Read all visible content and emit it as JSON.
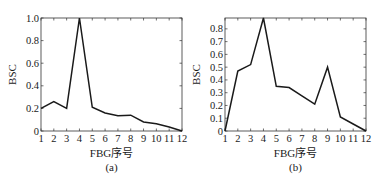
{
  "chart_data": [
    {
      "type": "line",
      "panel": "(a)",
      "title": "",
      "xlabel": "FBG序号",
      "ylabel": "BSC",
      "caption": "(a)",
      "x": [
        1,
        2,
        3,
        4,
        5,
        6,
        7,
        8,
        9,
        10,
        11,
        12
      ],
      "series": [
        {
          "name": "BSC",
          "values": [
            0.2,
            0.26,
            0.2,
            1.0,
            0.21,
            0.16,
            0.135,
            0.14,
            0.08,
            0.065,
            0.035,
            0.0
          ]
        }
      ],
      "xlim": [
        1,
        12
      ],
      "ylim": [
        0,
        1.0
      ],
      "xticks": [
        "1",
        "2",
        "3",
        "4",
        "5",
        "6",
        "7",
        "8",
        "9",
        "10",
        "11",
        "12"
      ],
      "yticks": [
        {
          "value": 0,
          "label": "0"
        },
        {
          "value": 0.2,
          "label": "0.2"
        },
        {
          "value": 0.4,
          "label": "0.4"
        },
        {
          "value": 0.6,
          "label": "0.6"
        },
        {
          "value": 0.8,
          "label": "0.8"
        },
        {
          "value": 1.0,
          "label": "1.0"
        }
      ],
      "grid": false,
      "legend": null,
      "line_color": "#1a1a1a"
    },
    {
      "type": "line",
      "panel": "(b)",
      "title": "",
      "xlabel": "FBG序号",
      "ylabel": "BSC",
      "caption": "(b)",
      "x": [
        1,
        2,
        3,
        4,
        5,
        6,
        7,
        8,
        9,
        10,
        11,
        12
      ],
      "series": [
        {
          "name": "BSC",
          "values": [
            0.0,
            0.47,
            0.52,
            0.885,
            0.35,
            0.34,
            0.275,
            0.21,
            0.5,
            0.11,
            0.055,
            0.0
          ]
        }
      ],
      "xlim": [
        1,
        12
      ],
      "ylim": [
        0,
        0.885
      ],
      "xticks": [
        "1",
        "2",
        "3",
        "4",
        "5",
        "6",
        "7",
        "8",
        "9",
        "10",
        "11",
        "12"
      ],
      "yticks": [
        {
          "value": 0,
          "label": "0"
        },
        {
          "value": 0.1,
          "label": "0.1"
        },
        {
          "value": 0.2,
          "label": "0.2"
        },
        {
          "value": 0.3,
          "label": "0.3"
        },
        {
          "value": 0.4,
          "label": "0.4"
        },
        {
          "value": 0.5,
          "label": "0.5"
        },
        {
          "value": 0.6,
          "label": "0.6"
        },
        {
          "value": 0.7,
          "label": "0.7"
        },
        {
          "value": 0.8,
          "label": "0.8"
        }
      ],
      "grid": false,
      "legend": null,
      "line_color": "#1a1a1a"
    }
  ],
  "layout": {
    "panels": [
      {
        "left": 41,
        "right": 182,
        "top": 18,
        "bottom": 131
      },
      {
        "left": 225,
        "right": 366,
        "top": 18,
        "bottom": 131
      }
    ]
  }
}
